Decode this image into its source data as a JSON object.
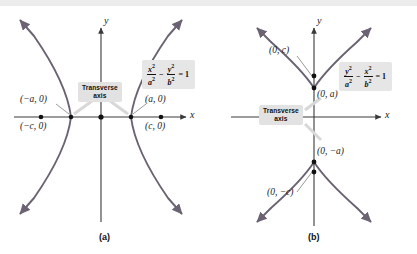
{
  "figure": {
    "colors": {
      "curve": "#6b6273",
      "axis": "#3a3a3a",
      "point": "#111111",
      "tag_background": "#e2e2e2",
      "equation_background": "#e6e6e6",
      "top_band": "#ececec",
      "text": "#111111"
    },
    "panels": [
      {
        "id": "a",
        "caption": "(a)",
        "orientation": "horizontal-transverse-axis",
        "axis_x_label": "x",
        "axis_y_label": "y",
        "transverse_tag": {
          "line1": "Transverse",
          "line2": "axis"
        },
        "equation": {
          "numerator_1": "x",
          "denominator_1": "a",
          "operator": "−",
          "numerator_2": "y",
          "denominator_2": "b",
          "equals": "= 1",
          "power": "2",
          "plain": "x²/a² − y²/b² = 1"
        },
        "points": [
          {
            "name": "vertex-left",
            "label": "(−a, 0)",
            "x": -1,
            "y": 0
          },
          {
            "name": "focus-left",
            "label": "(−c, 0)",
            "x": -1.6,
            "y": 0
          },
          {
            "name": "center",
            "label": "",
            "x": 0,
            "y": 0
          },
          {
            "name": "vertex-right",
            "label": "(a, 0)",
            "x": 1,
            "y": 0
          },
          {
            "name": "focus-right",
            "label": "(c, 0)",
            "x": 1.6,
            "y": 0
          }
        ]
      },
      {
        "id": "b",
        "caption": "(b)",
        "orientation": "vertical-transverse-axis",
        "axis_x_label": "x",
        "axis_y_label": "y",
        "transverse_tag": {
          "line1": "Transverse",
          "line2": "axis"
        },
        "equation": {
          "numerator_1": "y",
          "denominator_1": "a",
          "operator": "−",
          "numerator_2": "x",
          "denominator_2": "b",
          "equals": "= 1",
          "power": "2",
          "plain": "y²/a² − x²/b² = 1"
        },
        "points": [
          {
            "name": "focus-upper",
            "label": "(0, c)",
            "x": 0,
            "y": 1.6
          },
          {
            "name": "vertex-upper",
            "label": "(0, a)",
            "x": 0,
            "y": 1
          },
          {
            "name": "vertex-lower",
            "label": "(0, −a)",
            "x": 0,
            "y": -1
          },
          {
            "name": "focus-lower",
            "label": "(0, −c)",
            "x": 0,
            "y": -1.6
          }
        ]
      }
    ]
  }
}
